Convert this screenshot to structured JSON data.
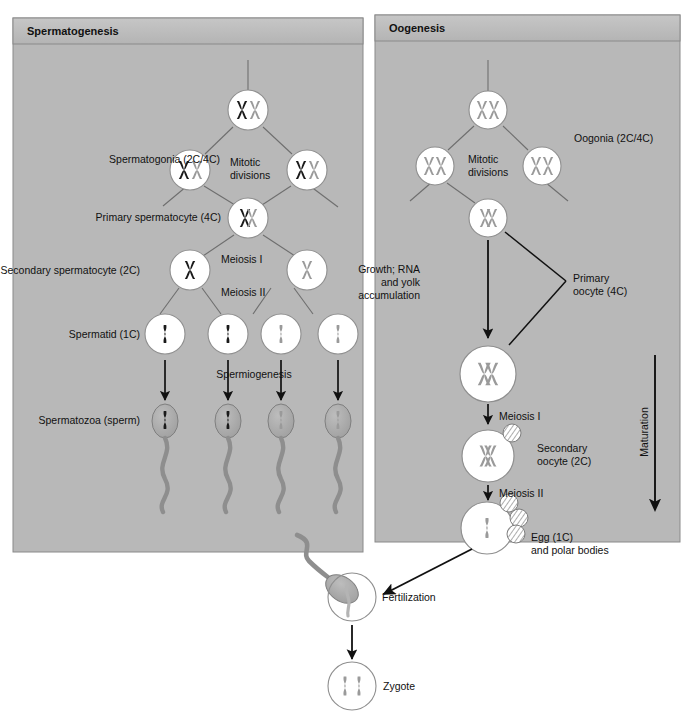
{
  "figure": {
    "type": "biology-diagram"
  },
  "panels": [
    {
      "id": "spermatogenesis",
      "title": "Spermatogenesis",
      "labels": {
        "spermatogonia": "Spermatogonia (2C/4C)",
        "mitotic_divisions": "Mitotic\ndivisions",
        "mitotic_line1": "Mitotic",
        "mitotic_line2": "divisions",
        "primary_spermatocyte": "Primary spermatocyte (4C)",
        "meiosis_i": "Meiosis I",
        "meiosis_ii": "Meiosis II",
        "secondary_spermatocyte": "Secondary spermatocyte (2C)",
        "spermatid": "Spermatid (1C)",
        "spermiogenesis": "Spermiogenesis",
        "spermatozoa": "Spermatozoa (sperm)"
      }
    },
    {
      "id": "oogenesis",
      "title": "Oogenesis",
      "labels": {
        "oogonia": "Oogonia (2C/4C)",
        "mitotic_line1": "Mitotic",
        "mitotic_line2": "divisions",
        "growth_line1": "Growth; RNA",
        "growth_line2": "and yolk",
        "growth_line3": "accumulation",
        "primary_oocyte_line1": "Primary",
        "primary_oocyte_line2": "oocyte (4C)",
        "meiosis_i": "Meiosis I",
        "secondary_oocyte_line1": "Secondary",
        "secondary_oocyte_line2": "oocyte (2C)",
        "meiosis_ii": "Meiosis II",
        "egg_line1": "Egg (1C)",
        "egg_line2": "and polar bodies",
        "maturation": "Maturation"
      }
    }
  ],
  "bottom": {
    "fertilization": "Fertilization",
    "zygote": "Zygote"
  },
  "colors": {
    "panel_background": "#b8b8b8",
    "panel_header": "#bdbdbd",
    "panel_border": "#8a8a8a",
    "cell_fill": "#ffffff",
    "cell_stroke": "#8f8f8f",
    "chromosome_dark": "#1a1a1a",
    "chromosome_light": "#9a9a9a",
    "sperm_head": "#a6a6a6",
    "sperm_tail": "#8e8e8e",
    "arrow": "#111111",
    "connector": "#6e6e6e",
    "page_background": "#ffffff"
  },
  "icons": {
    "cell": "cell-circle-icon",
    "chromosome_x": "chromosome-x-icon",
    "chromatid": "chromatid-icon",
    "sperm": "sperm-icon",
    "polar_body": "polar-body-icon",
    "arrow_down": "arrow-down-icon",
    "maturation_arrow": "maturation-arrow-icon"
  }
}
